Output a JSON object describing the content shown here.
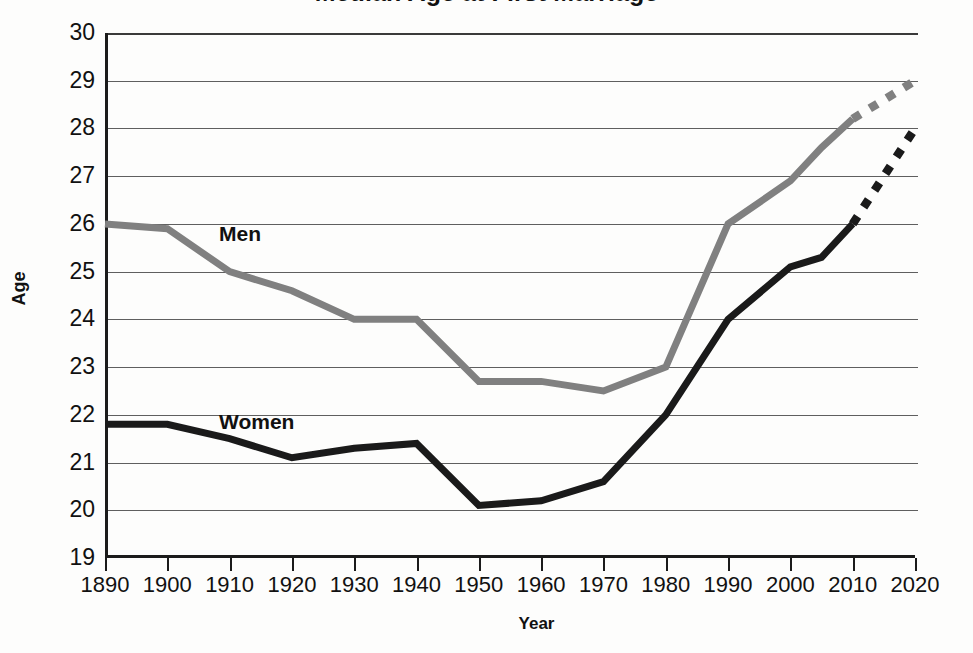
{
  "chart_data": {
    "type": "line",
    "title": "Median Age at First Marriage",
    "xlabel": "Year",
    "ylabel": "Age",
    "xlim": [
      1890,
      2020
    ],
    "ylim": [
      19,
      30
    ],
    "grid": true,
    "legend_position": "inline-labels",
    "x_tick_labels": [
      "1890",
      "1900",
      "1910",
      "1920",
      "1930",
      "1940",
      "1950",
      "1960",
      "1970",
      "1980",
      "1990",
      "2000",
      "2010",
      "2020"
    ],
    "y_tick_labels": [
      "30",
      "29",
      "28",
      "27",
      "26",
      "25",
      "24",
      "23",
      "22",
      "21",
      "20",
      "19"
    ],
    "categories": [
      1890,
      1900,
      1910,
      1920,
      1930,
      1940,
      1950,
      1960,
      1970,
      1980,
      1990,
      2000,
      2005,
      2010,
      2020
    ],
    "series": [
      {
        "name": "Men",
        "color": "#808080",
        "solid_until": 2010,
        "projected_style": "dotted",
        "values": [
          26.0,
          25.9,
          25.0,
          24.6,
          24.0,
          24.0,
          22.7,
          22.7,
          22.5,
          23.0,
          26.0,
          26.9,
          27.6,
          28.2,
          29.0
        ]
      },
      {
        "name": "Women",
        "color": "#1a1a1a",
        "solid_until": 2010,
        "projected_style": "dotted",
        "values": [
          21.8,
          21.8,
          21.5,
          21.1,
          21.3,
          21.4,
          20.1,
          20.2,
          20.6,
          22.0,
          24.0,
          25.1,
          25.3,
          26.0,
          28.0
        ]
      }
    ],
    "annotations": [
      {
        "text": "Men",
        "x": 1920,
        "y": 25.6
      },
      {
        "text": "Women",
        "x": 1920,
        "y": 21.9
      }
    ]
  },
  "axes": {
    "y_title": "Age",
    "x_title": "Year"
  },
  "labels": {
    "men": "Men",
    "women": "Women"
  }
}
